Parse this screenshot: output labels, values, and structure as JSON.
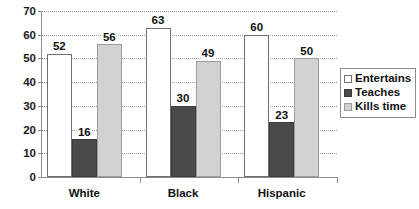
{
  "chart_data": {
    "type": "bar",
    "title": "",
    "subtitle": "",
    "xlabel": "",
    "ylabel": "",
    "ylim": [
      0,
      70
    ],
    "ytick_step": 10,
    "yticks": [
      0,
      10,
      20,
      30,
      40,
      50,
      60,
      70
    ],
    "ytick_labels": [
      "0",
      "10",
      "20",
      "30",
      "40",
      "50",
      "60",
      "70"
    ],
    "categories": [
      "White",
      "Black",
      "Hispanic"
    ],
    "series": [
      {
        "name": "Entertains",
        "values": [
          52,
          63,
          60
        ],
        "color": "#ffffff"
      },
      {
        "name": "Teaches",
        "values": [
          16,
          30,
          23
        ],
        "color": "#4a4a4a"
      },
      {
        "name": "Kills time",
        "values": [
          56,
          49,
          50
        ],
        "color": "#d2d2d2"
      }
    ],
    "data_labels": {
      "White": [
        "52",
        "16",
        "56"
      ],
      "Black": [
        "63",
        "30",
        "49"
      ],
      "Hispanic": [
        "60",
        "23",
        "50"
      ]
    },
    "grid": true,
    "grid_style": "dotted-horizontal",
    "legend_position": "right",
    "legend_entries": [
      "Entertains",
      "Teaches",
      "Kills time"
    ]
  },
  "legend": {
    "items": [
      {
        "label": "Entertains"
      },
      {
        "label": "Teaches"
      },
      {
        "label": "Kills time"
      }
    ]
  },
  "axes": {
    "y_labels": [
      "70",
      "60",
      "50",
      "40",
      "30",
      "20",
      "10",
      "0"
    ],
    "x_labels": [
      "White",
      "Black",
      "Hispanic"
    ]
  }
}
